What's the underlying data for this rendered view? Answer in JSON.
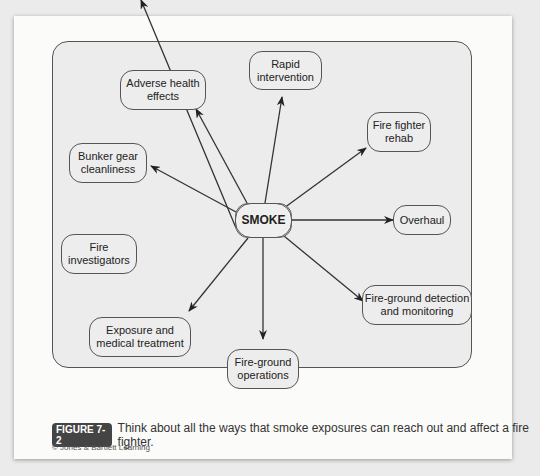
{
  "diagram": {
    "center": {
      "label": "SMOKE"
    },
    "nodes": [
      {
        "id": "rapid",
        "label": "Rapid intervention"
      },
      {
        "id": "adverse",
        "label": "Adverse health effects"
      },
      {
        "id": "rehab",
        "label": "Fire fighter rehab"
      },
      {
        "id": "bunker",
        "label": "Bunker gear cleanliness"
      },
      {
        "id": "overhaul",
        "label": "Overhaul"
      },
      {
        "id": "investigators",
        "label": "Fire investigators"
      },
      {
        "id": "detection",
        "label": "Fire-ground detection and monitoring"
      },
      {
        "id": "exposure",
        "label": "Exposure and medical treatment"
      },
      {
        "id": "operations",
        "label": "Fire-ground operations"
      }
    ],
    "edges": [
      "SMOKE→Rapid intervention",
      "SMOKE→Adverse health effects",
      "SMOKE→Fire fighter rehab",
      "SMOKE→Bunker gear cleanliness",
      "SMOKE→Overhaul",
      "SMOKE→Fire investigators",
      "SMOKE→Fire-ground detection and monitoring",
      "SMOKE→Exposure and medical treatment",
      "SMOKE→Fire-ground operations"
    ]
  },
  "caption": {
    "figure_label": "FIGURE 7-2",
    "text": "Think about all the ways that smoke exposures can reach out and affect a fire fighter.",
    "credit": "© Jones & Bartlett Learning"
  }
}
